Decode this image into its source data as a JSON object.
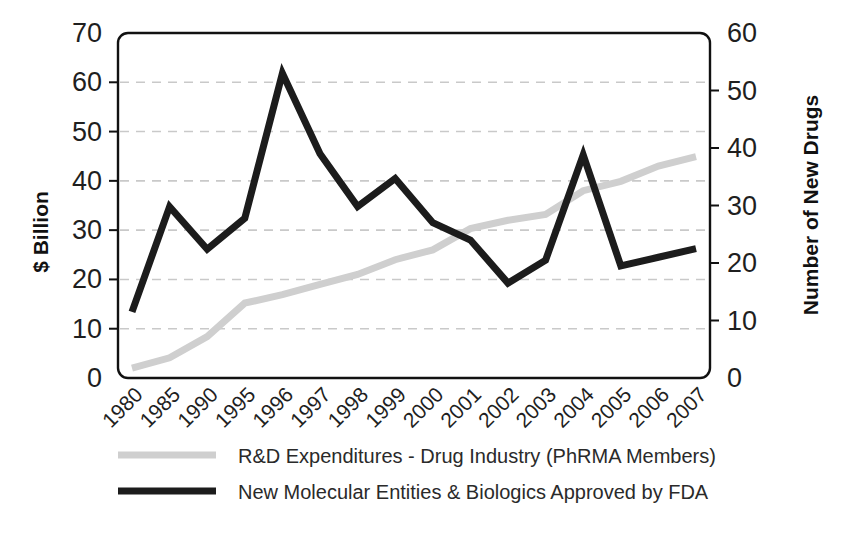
{
  "chart_data": {
    "type": "line",
    "title": "",
    "xlabel": "",
    "ylabel": "$ Billion",
    "y2label": "Number of New Drugs",
    "grid": true,
    "legend_position": "bottom",
    "ylim": [
      0,
      70
    ],
    "y2lim": [
      0,
      60
    ],
    "ytick_labels": [
      "0",
      "10",
      "20",
      "30",
      "40",
      "50",
      "60",
      "70"
    ],
    "ytick_values": [
      0,
      10,
      20,
      30,
      40,
      50,
      60,
      70
    ],
    "y2tick_labels": [
      "0",
      "10",
      "20",
      "30",
      "40",
      "50",
      "60"
    ],
    "y2tick_values": [
      0,
      10,
      20,
      30,
      40,
      50,
      60
    ],
    "categories": [
      "1980",
      "1985",
      "1990",
      "1995",
      "1996",
      "1997",
      "1998",
      "1999",
      "2000",
      "2001",
      "2002",
      "2003",
      "2004",
      "2005",
      "2006",
      "2007"
    ],
    "series": [
      {
        "name": "R&D Expenditures - Drug Industry (PhRMA Members)",
        "axis": "left",
        "unit": "$ Billion",
        "color": "#cfcfcf",
        "width": 7,
        "values": [
          2.0,
          4.1,
          8.4,
          15.2,
          16.9,
          19.0,
          21.0,
          24.0,
          26.0,
          30.3,
          32.0,
          33.2,
          38.0,
          39.9,
          43.0,
          44.9
        ]
      },
      {
        "name": "New Molecular Entities & Biologics Approved by FDA",
        "axis": "right",
        "unit": "Number of New Drugs",
        "color": "#1c1c1c",
        "width": 7,
        "values": [
          11.5,
          29.8,
          22.4,
          27.8,
          53.0,
          39.0,
          29.8,
          34.7,
          27.0,
          24.0,
          16.5,
          20.5,
          38.8,
          19.5,
          21.0,
          22.5
        ]
      }
    ]
  },
  "legend": {
    "items": [
      {
        "label": "R&D Expenditures - Drug Industry (PhRMA Members)",
        "color": "#cfcfcf"
      },
      {
        "label": "New Molecular Entities & Biologics Approved by FDA",
        "color": "#1c1c1c"
      }
    ]
  }
}
